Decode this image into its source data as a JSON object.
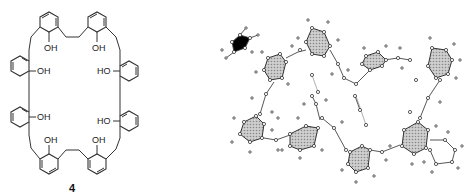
{
  "figure": {
    "compound_label": "4",
    "hydroxyl_label": "OH",
    "hydroxyl_label_left": "HO",
    "structure_2d": {
      "description": "Cyclic octamer of phenol units linked by ethylene bridges",
      "rings": 8,
      "substituent": "OH"
    },
    "structure_3d": {
      "description": "Ball-and-stick crystal structure model with shaded aromatic rings",
      "shaded_rings": 7
    },
    "colors": {
      "line": "#333333",
      "ring_fill": "#bbbbbb",
      "background": "#ffffff"
    }
  }
}
